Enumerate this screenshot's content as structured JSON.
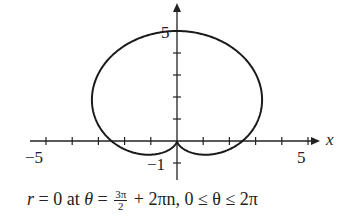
{
  "chart_data": {
    "type": "line",
    "subtype": "polar",
    "title": "",
    "equation_hint": "cardioid r = 2.5(1 + sin θ)",
    "xlabel": "x",
    "ylabel": "",
    "xlim": [
      -5.5,
      5.5
    ],
    "ylim": [
      -1.5,
      6
    ],
    "x_ticks": [
      -5,
      -4,
      -3,
      -2,
      -1,
      1,
      2,
      3,
      4,
      5
    ],
    "x_tick_labels": {
      "-5": "−5",
      "5": "5"
    },
    "y_ticks": [
      -1,
      1,
      2,
      3,
      4,
      5
    ],
    "y_tick_labels": {
      "-1": "−1",
      "5": "5"
    },
    "grid": false,
    "key_points": [
      {
        "x": 0,
        "y": 5,
        "note": "top"
      },
      {
        "x": 0,
        "y": 0,
        "note": "cusp"
      },
      {
        "x": -2.5,
        "y": 0
      },
      {
        "x": 2.5,
        "y": 0
      }
    ],
    "annotation": "r = 0 at θ = 3π/2 + 2πn, 0 ≤ θ ≤ 2π"
  },
  "labels": {
    "x_axis": "x",
    "x_min": "−5",
    "x_max": "5",
    "y_max": "5",
    "y_min": "−1"
  },
  "caption": {
    "lhs": "r",
    "eq1": " = 0 at ",
    "theta": "θ",
    "eq2": " = ",
    "frac_num": "3π",
    "frac_den": "2",
    "rest": " + 2πn, 0 ≤ θ ≤ 2π"
  }
}
